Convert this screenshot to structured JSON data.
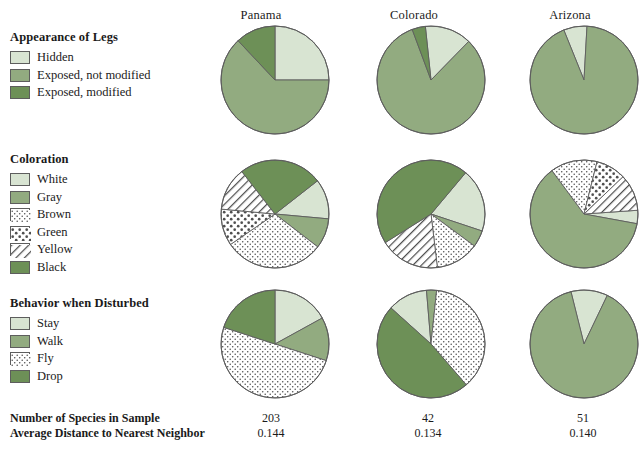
{
  "columns": [
    {
      "name": "Panama"
    },
    {
      "name": "Colorado"
    },
    {
      "name": "Arizona"
    }
  ],
  "legends": [
    {
      "title": "Appearance of Legs",
      "items": [
        {
          "label": "Hidden",
          "fill": "#d8e4d2",
          "pattern": "solid"
        },
        {
          "label": "Exposed, not modified",
          "fill": "#92ab80",
          "pattern": "solid"
        },
        {
          "label": "Exposed, modified",
          "fill": "#6d9057",
          "pattern": "solid"
        }
      ]
    },
    {
      "title": "Coloration",
      "items": [
        {
          "label": "White",
          "fill": "#d8e4d2",
          "pattern": "solid"
        },
        {
          "label": "Gray",
          "fill": "#92ab80",
          "pattern": "solid"
        },
        {
          "label": "Brown",
          "fill": "#ffffff",
          "pattern": "fine-dots"
        },
        {
          "label": "Green",
          "fill": "#ffffff",
          "pattern": "coarse-dots"
        },
        {
          "label": "Yellow",
          "fill": "#ffffff",
          "pattern": "diagonal-hatch"
        },
        {
          "label": "Black",
          "fill": "#6d9057",
          "pattern": "solid"
        }
      ]
    },
    {
      "title": "Behavior when Disturbed",
      "items": [
        {
          "label": "Stay",
          "fill": "#d8e4d2",
          "pattern": "solid"
        },
        {
          "label": "Walk",
          "fill": "#92ab80",
          "pattern": "solid"
        },
        {
          "label": "Fly",
          "fill": "#ffffff",
          "pattern": "fine-dots"
        },
        {
          "label": "Drop",
          "fill": "#6d9057",
          "pattern": "solid"
        }
      ]
    }
  ],
  "summary": {
    "rows": [
      {
        "label": "Number of Species in Sample",
        "values": [
          "203",
          "42",
          "51"
        ]
      },
      {
        "label": "Average Distance to Nearest Neighbor",
        "values": [
          "0.144",
          "0.134",
          "0.140"
        ]
      }
    ]
  },
  "chart_data": {
    "type": "pie",
    "grid": false,
    "legend_position": "left",
    "categories_columns": [
      "Panama",
      "Colorado",
      "Arizona"
    ],
    "charts": [
      {
        "row": "Appearance of Legs",
        "categories": [
          "Hidden",
          "Exposed, not modified",
          "Exposed, modified"
        ],
        "pies": [
          {
            "column": "Panama",
            "values": [
              25,
              63,
              12
            ]
          },
          {
            "column": "Colorado",
            "values": [
              14,
              82,
              4
            ]
          },
          {
            "column": "Arizona",
            "values": [
              7,
              93,
              0
            ]
          }
        ]
      },
      {
        "row": "Coloration",
        "categories": [
          "White",
          "Gray",
          "Brown",
          "Green",
          "Yellow",
          "Black"
        ],
        "pies": [
          {
            "column": "Panama",
            "values": [
              12,
              9,
              30,
              11,
              13,
              25
            ]
          },
          {
            "column": "Colorado",
            "values": [
              19,
              5,
              13,
              0,
              18,
              45
            ]
          },
          {
            "column": "Arizona",
            "values": [
              4,
              62,
              14,
              9,
              11,
              0
            ]
          }
        ]
      },
      {
        "row": "Behavior when Disturbed",
        "categories": [
          "Stay",
          "Walk",
          "Fly",
          "Drop"
        ],
        "pies": [
          {
            "column": "Panama",
            "values": [
              17,
              13,
              50,
              20
            ]
          },
          {
            "column": "Colorado",
            "values": [
              12,
              3,
              37,
              48
            ]
          },
          {
            "column": "Arizona",
            "values": [
              11,
              89,
              0,
              0
            ]
          }
        ]
      }
    ],
    "palette": {
      "light": "#d8e4d2",
      "medium": "#92ab80",
      "dark": "#6d9057",
      "white": "#ffffff",
      "outline": "#5d5d5d"
    }
  }
}
